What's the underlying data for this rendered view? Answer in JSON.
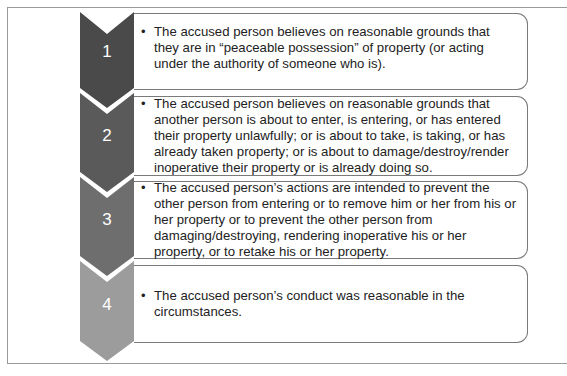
{
  "diagram": {
    "type": "vertical-chevron-process",
    "steps": [
      {
        "number": "1",
        "color": "#4a4a4a",
        "bullet": "•",
        "text": "The accused person believes on reasonable grounds that they are in “peaceable possession” of property (or acting under the authority of someone who is)."
      },
      {
        "number": "2",
        "color": "#5a5a5a",
        "bullet": "•",
        "text": "The accused person believes on reasonable grounds that another person is about to enter, is entering, or has entered their property unlawfully; or is about to take, is taking, or has already taken property; or is about to damage/destroy/render inoperative their property or is already doing so."
      },
      {
        "number": "3",
        "color": "#6e6e6e",
        "bullet": "•",
        "text": "The accused person’s actions are intended to prevent the other person from entering or to remove him or her from his or her property or to prevent the other person from damaging/destroying, rendering inoperative his or her property, or to retake his or her property."
      },
      {
        "number": "4",
        "color": "#9c9c9c",
        "bullet": "•",
        "text": "The accused person’s conduct was reasonable in the circumstances."
      }
    ]
  }
}
